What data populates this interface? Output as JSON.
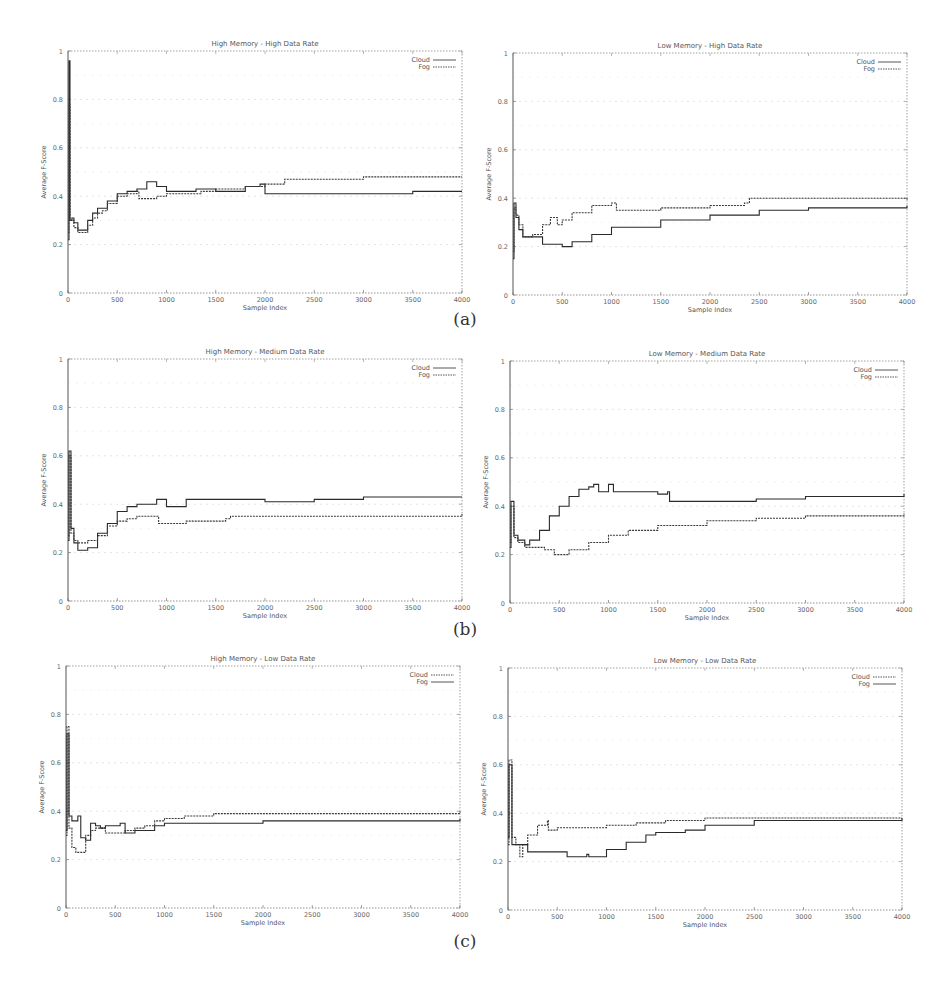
{
  "figure": {
    "captions": [
      "(a)",
      "(b)",
      "(c)"
    ]
  },
  "chart_data": [
    {
      "id": "a-left",
      "type": "line",
      "title": "High Memory - High Data Rate",
      "xlabel": "Sample Index",
      "ylabel": "Average F-Score",
      "xlim": [
        0,
        4000
      ],
      "ylim": [
        0,
        1
      ],
      "xticks": [
        0,
        500,
        1000,
        1500,
        2000,
        2500,
        3000,
        3500,
        4000
      ],
      "yticks": [
        0,
        0.2,
        0.4,
        0.6,
        0.8,
        1
      ],
      "ytick_labels": [
        "0",
        "0.2",
        "0.4",
        "0.6",
        "0.8",
        "1"
      ],
      "grid": true,
      "legend_position": "top-right",
      "legend": [
        {
          "name": "Cloud",
          "style": "solid"
        },
        {
          "name": "Fog",
          "style": "dashed"
        }
      ],
      "series": [
        {
          "name": "Cloud",
          "x": [
            0,
            10,
            20,
            40,
            60,
            100,
            150,
            200,
            250,
            300,
            350,
            400,
            500,
            600,
            700,
            800,
            900,
            1000,
            1300,
            1500,
            1800,
            1950,
            2000,
            2500,
            3000,
            3500,
            4000
          ],
          "y": [
            0.22,
            0.96,
            0.3,
            0.31,
            0.29,
            0.26,
            0.26,
            0.3,
            0.33,
            0.35,
            0.35,
            0.38,
            0.41,
            0.42,
            0.43,
            0.46,
            0.44,
            0.42,
            0.43,
            0.42,
            0.44,
            0.45,
            0.41,
            0.41,
            0.41,
            0.42,
            0.42
          ]
        },
        {
          "name": "Fog",
          "x": [
            0,
            10,
            20,
            40,
            60,
            100,
            150,
            200,
            250,
            300,
            350,
            400,
            500,
            600,
            700,
            720,
            800,
            900,
            1000,
            1300,
            1350,
            1500,
            1800,
            2000,
            2200,
            2500,
            2800,
            3000,
            3500,
            4000
          ],
          "y": [
            0.25,
            0.78,
            0.3,
            0.3,
            0.27,
            0.25,
            0.25,
            0.28,
            0.31,
            0.33,
            0.34,
            0.37,
            0.4,
            0.41,
            0.42,
            0.39,
            0.39,
            0.4,
            0.41,
            0.41,
            0.42,
            0.43,
            0.44,
            0.45,
            0.47,
            0.47,
            0.47,
            0.48,
            0.48,
            0.48
          ]
        }
      ]
    },
    {
      "id": "a-right",
      "type": "line",
      "title": "Low Memory - High Data Rate",
      "xlabel": "Sample Index",
      "ylabel": "Average F-Score",
      "xlim": [
        0,
        4000
      ],
      "ylim": [
        0,
        1
      ],
      "xticks": [
        0,
        500,
        1000,
        1500,
        2000,
        2500,
        3000,
        3500,
        4000
      ],
      "yticks": [
        0,
        0.2,
        0.4,
        0.6,
        0.8,
        1
      ],
      "ytick_labels": [
        "0",
        "0.2",
        "0.4",
        "0.6",
        "0.8",
        "1"
      ],
      "grid": true,
      "legend_position": "top-right",
      "legend": [
        {
          "name": "Cloud",
          "style": "solid"
        },
        {
          "name": "Fog",
          "style": "dashed"
        }
      ],
      "series": [
        {
          "name": "Cloud",
          "x": [
            0,
            10,
            30,
            60,
            100,
            200,
            300,
            400,
            500,
            600,
            800,
            1000,
            1500,
            2000,
            2500,
            3000,
            3500,
            4000
          ],
          "y": [
            0.15,
            0.38,
            0.32,
            0.27,
            0.24,
            0.24,
            0.21,
            0.21,
            0.2,
            0.22,
            0.25,
            0.28,
            0.31,
            0.33,
            0.35,
            0.36,
            0.36,
            0.37
          ]
        },
        {
          "name": "Fog",
          "x": [
            0,
            10,
            30,
            60,
            100,
            200,
            300,
            380,
            450,
            500,
            600,
            800,
            1000,
            1050,
            1500,
            2000,
            2350,
            2400,
            2700,
            3000,
            3500,
            4000
          ],
          "y": [
            0.18,
            0.36,
            0.33,
            0.29,
            0.24,
            0.25,
            0.29,
            0.32,
            0.29,
            0.31,
            0.34,
            0.37,
            0.38,
            0.35,
            0.36,
            0.37,
            0.38,
            0.4,
            0.4,
            0.4,
            0.4,
            0.39
          ]
        }
      ]
    },
    {
      "id": "b-left",
      "type": "line",
      "title": "High Memory - Medium Data Rate",
      "xlabel": "Sample Index",
      "ylabel": "Average F-Score",
      "xlim": [
        0,
        4000
      ],
      "ylim": [
        0,
        1
      ],
      "xticks": [
        0,
        500,
        1000,
        1500,
        2000,
        2500,
        3000,
        3500,
        4000
      ],
      "yticks": [
        0,
        0.2,
        0.4,
        0.6,
        0.8,
        1
      ],
      "ytick_labels": [
        "0",
        "0.2",
        "0.4",
        "0.6",
        "0.8",
        "1"
      ],
      "grid": true,
      "legend_position": "top-right",
      "legend": [
        {
          "name": "Cloud",
          "style": "solid"
        },
        {
          "name": "Fog",
          "style": "dashed"
        }
      ],
      "series": [
        {
          "name": "Cloud",
          "x": [
            0,
            10,
            30,
            60,
            100,
            200,
            300,
            400,
            500,
            600,
            700,
            800,
            900,
            1000,
            1200,
            1500,
            2000,
            2500,
            3000,
            3500,
            4000
          ],
          "y": [
            0.25,
            0.62,
            0.3,
            0.24,
            0.21,
            0.22,
            0.28,
            0.32,
            0.37,
            0.39,
            0.4,
            0.4,
            0.42,
            0.39,
            0.42,
            0.42,
            0.41,
            0.42,
            0.43,
            0.43,
            0.43
          ]
        },
        {
          "name": "Fog",
          "x": [
            0,
            10,
            30,
            60,
            100,
            200,
            300,
            400,
            500,
            600,
            700,
            800,
            900,
            920,
            1200,
            1600,
            1650,
            2000,
            2500,
            3000,
            3500,
            4000
          ],
          "y": [
            0.27,
            0.6,
            0.28,
            0.25,
            0.24,
            0.25,
            0.27,
            0.31,
            0.33,
            0.34,
            0.35,
            0.35,
            0.35,
            0.32,
            0.33,
            0.34,
            0.35,
            0.35,
            0.35,
            0.35,
            0.35,
            0.36
          ]
        }
      ]
    },
    {
      "id": "b-right",
      "type": "line",
      "title": "Low Memory - Medium Data Rate",
      "xlabel": "Sample Index",
      "ylabel": "Average F-Score",
      "xlim": [
        0,
        4000
      ],
      "ylim": [
        0,
        1
      ],
      "xticks": [
        0,
        500,
        1000,
        1500,
        2000,
        2500,
        3000,
        3500,
        4000
      ],
      "yticks": [
        0,
        0.2,
        0.4,
        0.6,
        0.8,
        1
      ],
      "ytick_labels": [
        "0",
        "0.2",
        "0.4",
        "0.6",
        "0.8",
        "1"
      ],
      "grid": true,
      "legend_position": "top-right",
      "legend": [
        {
          "name": "Cloud",
          "style": "solid"
        },
        {
          "name": "Fog",
          "style": "dashed"
        }
      ],
      "series": [
        {
          "name": "Cloud",
          "x": [
            0,
            10,
            40,
            80,
            150,
            200,
            300,
            400,
            500,
            600,
            700,
            800,
            850,
            900,
            1000,
            1050,
            1300,
            1500,
            1600,
            1620,
            2000,
            2500,
            3000,
            3500,
            4000
          ],
          "y": [
            0.23,
            0.42,
            0.28,
            0.26,
            0.24,
            0.26,
            0.3,
            0.36,
            0.4,
            0.44,
            0.47,
            0.48,
            0.49,
            0.46,
            0.49,
            0.46,
            0.46,
            0.45,
            0.46,
            0.42,
            0.42,
            0.43,
            0.44,
            0.44,
            0.45
          ]
        },
        {
          "name": "Fog",
          "x": [
            0,
            10,
            40,
            80,
            150,
            200,
            350,
            450,
            500,
            600,
            800,
            1000,
            1200,
            1500,
            2000,
            2500,
            3000,
            3500,
            4000
          ],
          "y": [
            0.25,
            0.4,
            0.27,
            0.25,
            0.23,
            0.23,
            0.22,
            0.2,
            0.2,
            0.22,
            0.25,
            0.28,
            0.3,
            0.32,
            0.34,
            0.35,
            0.36,
            0.36,
            0.37
          ]
        }
      ]
    },
    {
      "id": "c-left",
      "type": "line",
      "title": "High Memory - Low Data Rate",
      "xlabel": "Sample Index",
      "ylabel": "Average F-Score",
      "xlim": [
        0,
        4000
      ],
      "ylim": [
        0,
        1
      ],
      "xticks": [
        0,
        500,
        1000,
        1500,
        2000,
        2500,
        3000,
        3500,
        4000
      ],
      "yticks": [
        0,
        0.2,
        0.4,
        0.6,
        0.8,
        1
      ],
      "ytick_labels": [
        "0",
        "0.2",
        "0.4",
        "0.6",
        "0.8",
        "1"
      ],
      "grid": true,
      "legend_position": "top-right",
      "legend": [
        {
          "name": "Cloud",
          "style": "dashed"
        },
        {
          "name": "Fog",
          "style": "solid"
        }
      ],
      "series": [
        {
          "name": "Cloud",
          "x": [
            0,
            10,
            30,
            60,
            100,
            150,
            200,
            250,
            300,
            400,
            500,
            600,
            700,
            800,
            900,
            1000,
            1200,
            1500,
            2000,
            2500,
            3000,
            3500,
            4000
          ],
          "y": [
            0.3,
            0.75,
            0.33,
            0.25,
            0.23,
            0.23,
            0.3,
            0.32,
            0.33,
            0.31,
            0.31,
            0.32,
            0.33,
            0.34,
            0.36,
            0.37,
            0.38,
            0.39,
            0.39,
            0.39,
            0.39,
            0.39,
            0.4
          ]
        },
        {
          "name": "Fog",
          "x": [
            0,
            10,
            30,
            60,
            100,
            120,
            150,
            200,
            250,
            300,
            350,
            400,
            500,
            550,
            600,
            700,
            900,
            1000,
            1200,
            1500,
            2000,
            2500,
            3000,
            3500,
            4000
          ],
          "y": [
            0.32,
            0.72,
            0.38,
            0.36,
            0.36,
            0.38,
            0.29,
            0.28,
            0.35,
            0.34,
            0.33,
            0.34,
            0.34,
            0.35,
            0.31,
            0.32,
            0.34,
            0.35,
            0.35,
            0.35,
            0.36,
            0.36,
            0.36,
            0.36,
            0.37
          ]
        }
      ]
    },
    {
      "id": "c-right",
      "type": "line",
      "title": "Low Memory - Low Data Rate",
      "xlabel": "Sample Index",
      "ylabel": "Average F-Score",
      "xlim": [
        0,
        4000
      ],
      "ylim": [
        0,
        1
      ],
      "xticks": [
        0,
        500,
        1000,
        1500,
        2000,
        2500,
        3000,
        3500,
        4000
      ],
      "yticks": [
        0,
        0.2,
        0.4,
        0.6,
        0.8,
        1
      ],
      "ytick_labels": [
        "0",
        "0.2",
        "0.4",
        "0.6",
        "0.8",
        "1"
      ],
      "grid": true,
      "legend_position": "top-right",
      "legend": [
        {
          "name": "Cloud",
          "style": "dashed"
        },
        {
          "name": "Fog",
          "style": "solid"
        }
      ],
      "series": [
        {
          "name": "Cloud",
          "x": [
            0,
            10,
            40,
            80,
            120,
            150,
            200,
            300,
            400,
            410,
            500,
            700,
            1000,
            1300,
            1600,
            2000,
            2500,
            3000,
            3500,
            4000
          ],
          "y": [
            0.27,
            0.62,
            0.3,
            0.27,
            0.22,
            0.27,
            0.31,
            0.35,
            0.37,
            0.33,
            0.34,
            0.34,
            0.35,
            0.36,
            0.37,
            0.38,
            0.38,
            0.38,
            0.38,
            0.38
          ]
        },
        {
          "name": "Fog",
          "x": [
            0,
            10,
            40,
            100,
            180,
            200,
            550,
            600,
            800,
            820,
            1000,
            1200,
            1400,
            1500,
            1800,
            2000,
            2500,
            3000,
            3500,
            4000
          ],
          "y": [
            0.3,
            0.6,
            0.27,
            0.27,
            0.27,
            0.24,
            0.24,
            0.22,
            0.23,
            0.22,
            0.25,
            0.28,
            0.31,
            0.32,
            0.33,
            0.35,
            0.37,
            0.37,
            0.37,
            0.38
          ]
        }
      ]
    }
  ]
}
